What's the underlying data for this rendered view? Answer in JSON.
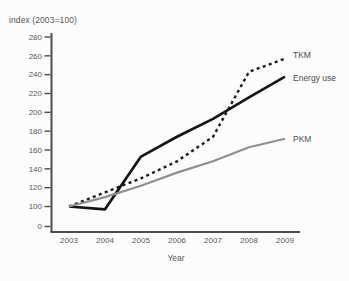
{
  "title": "index (2003=100)",
  "chart_data": {
    "type": "line",
    "title": "",
    "xlabel": "Year",
    "ylabel": "index (2003=100)",
    "x": [
      2003,
      2004,
      2005,
      2006,
      2007,
      2008,
      2009
    ],
    "yticks": [
      0,
      100,
      120,
      140,
      160,
      180,
      200,
      220,
      240,
      260,
      280
    ],
    "axis_note": "broken y-axis: 0 tick drawn one step below 100",
    "ylim": [
      0,
      280
    ],
    "grid": "off",
    "legend_position": "labels-at-line-ends-right",
    "axis_color": "#4d4d4d",
    "series": [
      {
        "name": "TKM",
        "style": "dotted",
        "color": "#1c1c1c",
        "values": [
          100,
          115,
          130,
          148,
          174,
          243,
          257
        ]
      },
      {
        "name": "Energy use",
        "style": "solid",
        "color": "#141414",
        "values": [
          100,
          97,
          153,
          174,
          193,
          216,
          238
        ]
      },
      {
        "name": "PKM",
        "style": "solid",
        "color": "#8f8f8f",
        "values": [
          100,
          110,
          122,
          136,
          148,
          163,
          172
        ]
      }
    ]
  }
}
